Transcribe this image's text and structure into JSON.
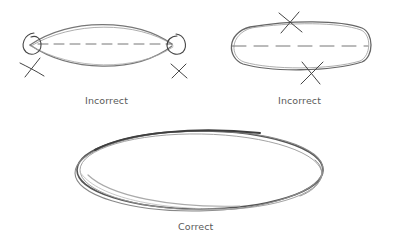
{
  "diagram": {
    "panels": [
      {
        "id": "pointed-ends",
        "label": "Incorrect",
        "description": "Lens-shaped ellipse with pointed ends circled and crossed out; dashed major axis",
        "marks": [
          "circle-left-end",
          "circle-right-end",
          "x-mark-left",
          "x-mark-right",
          "dashed-axis"
        ]
      },
      {
        "id": "flat-sides",
        "label": "Incorrect",
        "description": "Ellipse with flattened top and bottom sides crossed out; dashed major axis",
        "marks": [
          "x-mark-top",
          "x-mark-bottom",
          "dashed-axis"
        ]
      },
      {
        "id": "smooth-ellipse",
        "label": "Correct",
        "description": "Smooth ellipse drawn with multiple loose overlapping strokes"
      }
    ],
    "colors": {
      "stroke": "#6e6e6e",
      "stroke_dark": "#4a4a4a",
      "label": "#5a5a5a",
      "background": "#ffffff"
    }
  }
}
